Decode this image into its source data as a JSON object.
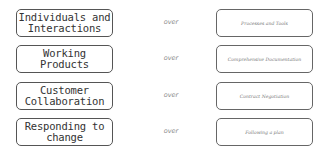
{
  "diagram": {
    "connector_word": "over",
    "rows": [
      {
        "left": "Individuals and Interactions",
        "right": "Processes and Tools"
      },
      {
        "left": "Working Products",
        "right": "Comprehensive Documentation"
      },
      {
        "left": "Customer Collaboration",
        "right": "Contract Negotiation"
      },
      {
        "left": "Responding to change",
        "right": "Following a plan"
      }
    ]
  }
}
